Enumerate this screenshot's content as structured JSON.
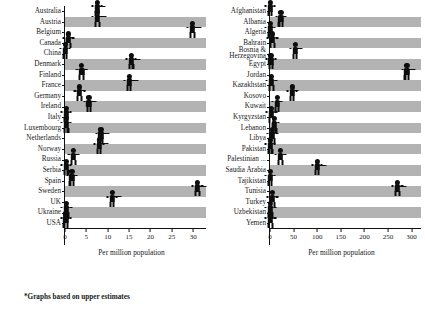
{
  "figure": {
    "footnote": "*Graphs based on upper estimates",
    "band_color": "#b3b3b3",
    "marker_color": "#0d0d0d",
    "background": "#ffffff"
  },
  "chart_data": [
    {
      "type": "bar",
      "orientation": "horizontal",
      "panel": "left",
      "title": "",
      "xlabel": "Per million population",
      "ylabel": "",
      "xlim": [
        0,
        33
      ],
      "xticks": [
        0,
        5,
        10,
        15,
        20,
        25,
        30
      ],
      "xticklabels": [
        "0",
        "5",
        "10",
        "15",
        "20",
        "25",
        "30"
      ],
      "grid": false,
      "legend": "none",
      "marker_style": "person-pictogram-with-whisker",
      "categories": [
        "Australia",
        "Austria",
        "Belgium",
        "Canada",
        "China",
        "Denmark",
        "Finland",
        "France",
        "Germany",
        "Ireland",
        "Italy",
        "Luxembourg",
        "Netherlands",
        "Norway",
        "Russia",
        "Serbia",
        "Spain",
        "Sweden",
        "UK",
        "Ukraine",
        "USA"
      ],
      "values": [
        7.5,
        7.6,
        29.8,
        0.8,
        0.05,
        15.5,
        3.9,
        15.0,
        3.4,
        5.6,
        0.25,
        0.3,
        8.4,
        8.0,
        2.0,
        0.3,
        1.6,
        31.0,
        11.0,
        0.35,
        0.2
      ]
    },
    {
      "type": "bar",
      "orientation": "horizontal",
      "panel": "right",
      "title": "",
      "xlabel": "Per million population",
      "ylabel": "",
      "xlim": [
        0,
        320
      ],
      "xticks": [
        0,
        50,
        100,
        150,
        200,
        250,
        300
      ],
      "xticklabels": [
        "0",
        "50",
        "100",
        "150",
        "200",
        "250",
        "300"
      ],
      "grid": false,
      "legend": "none",
      "marker_style": "person-pictogram-with-whisker",
      "categories": [
        "Afghanistan",
        "Albania",
        "Algeria",
        "Bahrain",
        "Bosnia & Herzegovina",
        "Egypt",
        "Jordan",
        "Kazakhstan",
        "Kosovo",
        "Kuwait",
        "Kyrgyzstan",
        "Lebanon",
        "Libya",
        "Pakistan",
        "Palestinian ...",
        "Saudia Arabia",
        "Tajikistan",
        "Tunisia",
        "Turkey",
        "Uzbekistan",
        "Yemen"
      ],
      "values": [
        0.4,
        23.0,
        0.6,
        5.0,
        53.0,
        2.0,
        290.0,
        3.0,
        47.0,
        15.0,
        3.0,
        9.0,
        5.0,
        0.5,
        22.0,
        100.0,
        0.4,
        270.0,
        5.0,
        1.0,
        1.0
      ]
    }
  ]
}
